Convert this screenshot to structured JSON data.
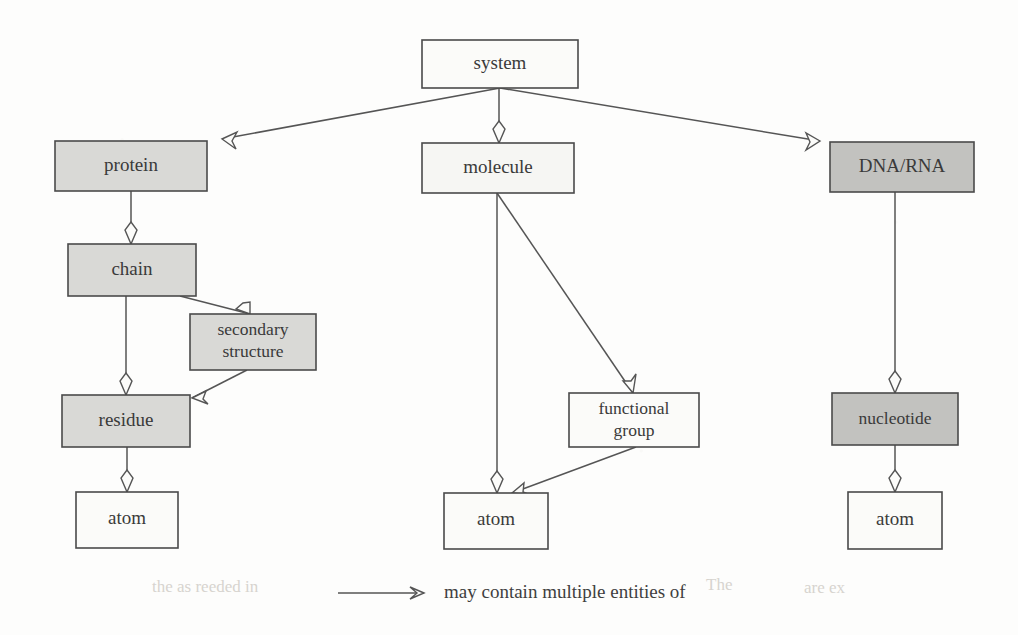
{
  "diagram": {
    "type": "tree-hierarchy",
    "background_color": "#fdfdfc",
    "line_color": "#555555",
    "fill_shaded": "#d9d9d6",
    "fill_dark": "#c2c2bf",
    "fill_plain": "#fbfbf9",
    "nodes": [
      {
        "id": "system",
        "label": "system",
        "x": 422,
        "y": 40,
        "w": 156,
        "h": 48,
        "fill": "#fbfbf9",
        "shade": "plain"
      },
      {
        "id": "protein",
        "label": "protein",
        "x": 55,
        "y": 141,
        "w": 152,
        "h": 50,
        "fill": "#d9d9d6",
        "shade": "shaded"
      },
      {
        "id": "molecule",
        "label": "molecule",
        "x": 422,
        "y": 143,
        "w": 152,
        "h": 50,
        "fill": "#f6f6f3",
        "shade": "plain"
      },
      {
        "id": "dnarna",
        "label": "DNA/RNA",
        "x": 830,
        "y": 142,
        "w": 144,
        "h": 50,
        "fill": "#c2c2bf",
        "shade": "dark"
      },
      {
        "id": "chain",
        "label": "chain",
        "x": 68,
        "y": 244,
        "w": 128,
        "h": 52,
        "fill": "#d9d9d6",
        "shade": "shaded"
      },
      {
        "id": "secondary",
        "label_line1": "secondary",
        "label_line2": "structure",
        "label": "secondary structure",
        "x": 190,
        "y": 314,
        "w": 126,
        "h": 56,
        "fill": "#d9d9d6",
        "shade": "shaded"
      },
      {
        "id": "residue",
        "label": "residue",
        "x": 62,
        "y": 395,
        "w": 128,
        "h": 52,
        "fill": "#d9d9d6",
        "shade": "shaded"
      },
      {
        "id": "funcgroup",
        "label_line1": "functional",
        "label_line2": "group",
        "label": "functional group",
        "x": 569,
        "y": 393,
        "w": 130,
        "h": 54,
        "fill": "#fbfbf9",
        "shade": "plain"
      },
      {
        "id": "nucleotide",
        "label": "nucleotide",
        "x": 832,
        "y": 393,
        "w": 126,
        "h": 52,
        "fill": "#c2c2bf",
        "shade": "dark"
      },
      {
        "id": "atom_left",
        "label": "atom",
        "x": 76,
        "y": 492,
        "w": 102,
        "h": 56,
        "fill": "#fbfbf9",
        "shade": "plain"
      },
      {
        "id": "atom_mid",
        "label": "atom",
        "x": 444,
        "y": 493,
        "w": 104,
        "h": 56,
        "fill": "#fbfbf9",
        "shade": "plain"
      },
      {
        "id": "atom_right",
        "label": "atom",
        "x": 848,
        "y": 492,
        "w": 94,
        "h": 57,
        "fill": "#fbfbf9",
        "shade": "plain"
      }
    ],
    "edges": [
      {
        "from": "system",
        "to": "protein",
        "relation": "may contain multiple entities of",
        "path": "M 500 88 L 212 141",
        "head": {
          "x": 212,
          "y": 141,
          "angle": 190
        }
      },
      {
        "from": "system",
        "to": "molecule",
        "relation": "may contain multiple entities of",
        "path": "M 500 88 L 498 143",
        "head": {
          "x": 498,
          "y": 143,
          "angle": 90
        }
      },
      {
        "from": "system",
        "to": "dnarna",
        "relation": "may contain multiple entities of",
        "path": "M 500 88 L 826 142",
        "head": {
          "x": 826,
          "y": 142,
          "angle": -10
        }
      },
      {
        "from": "protein",
        "to": "chain",
        "relation": "may contain multiple entities of",
        "path": "M 131 191 L 131 244",
        "head": {
          "x": 131,
          "y": 244,
          "angle": 90
        }
      },
      {
        "from": "chain",
        "to": "secondary",
        "relation": "may contain multiple entities of",
        "path": "M 184 296 L 246 314",
        "head": {
          "x": 246,
          "y": 314,
          "angle": 16
        }
      },
      {
        "from": "chain",
        "to": "residue",
        "relation": "may contain multiple entities of",
        "path": "M 126 296 L 126 395",
        "head": {
          "x": 126,
          "y": 395,
          "angle": 90
        }
      },
      {
        "from": "secondary",
        "to": "residue",
        "relation": "may contain multiple entities of",
        "path": "M 245 370 L 190 399",
        "head": {
          "x": 190,
          "y": 399,
          "angle": 152
        }
      },
      {
        "from": "residue",
        "to": "atom_left",
        "relation": "may contain multiple entities of",
        "path": "M 127 447 L 127 492",
        "head": {
          "x": 127,
          "y": 492,
          "angle": 90
        }
      },
      {
        "from": "molecule",
        "to": "atom_mid",
        "relation": "may contain multiple entities of",
        "path": "M 497 193 L 497 493",
        "head": {
          "x": 497,
          "y": 493,
          "angle": 90
        }
      },
      {
        "from": "molecule",
        "to": "funcgroup",
        "relation": "may contain multiple entities of",
        "path": "M 497 193 L 632 393",
        "head": {
          "x": 632,
          "y": 393,
          "angle": 56
        }
      },
      {
        "from": "funcgroup",
        "to": "atom_mid",
        "relation": "may contain multiple entities of",
        "path": "M 634 447 L 509 493",
        "head": {
          "x": 509,
          "y": 493,
          "angle": 160
        }
      },
      {
        "from": "dnarna",
        "to": "nucleotide",
        "relation": "may contain multiple entities of",
        "path": "M 895 192 L 895 393",
        "head": {
          "x": 895,
          "y": 393,
          "angle": 90
        }
      },
      {
        "from": "nucleotide",
        "to": "atom_right",
        "relation": "may contain multiple entities of",
        "path": "M 895 445 L 895 492",
        "head": {
          "x": 895,
          "y": 492,
          "angle": 90
        }
      }
    ],
    "legend": {
      "arrow_x1": 338,
      "arrow_x2": 424,
      "arrow_y": 593,
      "label": "may contain multiple entities of",
      "label_x": 444,
      "label_y": 594
    },
    "background_ghost_text": [
      {
        "text": "the  as  reeded  in",
        "x": 152,
        "y": 588
      },
      {
        "text": "The",
        "x": 706,
        "y": 586
      },
      {
        "text": "are  ex",
        "x": 804,
        "y": 589
      }
    ]
  }
}
